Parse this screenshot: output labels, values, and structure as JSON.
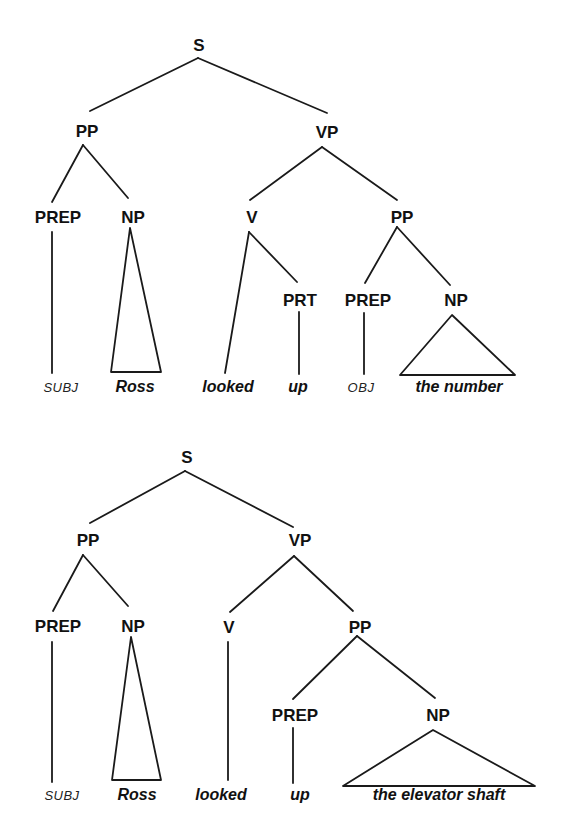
{
  "diagram_type": "syntax-tree",
  "colors": {
    "background": "#ffffff",
    "ink": "#111111"
  },
  "trees": [
    {
      "id": "tree-1",
      "sentence": "SUBJ Ross looked up OBJ the number",
      "nodes": {
        "s": "S",
        "pp": "PP",
        "vp": "VP",
        "pp_prep": "PREP",
        "pp_np": "NP",
        "v": "V",
        "vp_pp": "PP",
        "prt": "PRT",
        "vp_pp_prep": "PREP",
        "vp_pp_np": "NP"
      },
      "leaves": {
        "subj": "SUBJ",
        "ross": "Ross",
        "looked": "looked",
        "up": "up",
        "obj": "OBJ",
        "np_phrase": "the number"
      }
    },
    {
      "id": "tree-2",
      "sentence": "SUBJ Ross looked up the elevator shaft",
      "nodes": {
        "s": "S",
        "pp": "PP",
        "vp": "VP",
        "pp_prep": "PREP",
        "pp_np": "NP",
        "v": "V",
        "vp_pp": "PP",
        "vp_pp_prep": "PREP",
        "vp_pp_np": "NP"
      },
      "leaves": {
        "subj": "SUBJ",
        "ross": "Ross",
        "looked": "looked",
        "up": "up",
        "np_phrase": "the elevator shaft"
      }
    }
  ]
}
